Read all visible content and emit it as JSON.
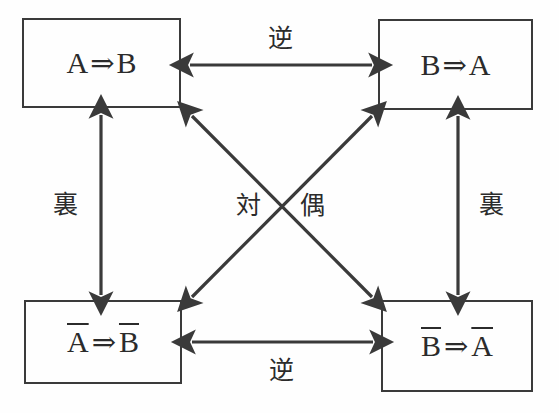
{
  "diagram": {
    "type": "logic-relation-diagram",
    "colors": {
      "line": "#3a3a3a",
      "text": "#2b2b2b",
      "background": "#fefefe"
    },
    "nodes": [
      {
        "id": "original",
        "role": "original-proposition",
        "position": "top-left",
        "antecedent": "A",
        "antecedent_negated": false,
        "consequent": "B",
        "consequent_negated": false,
        "implication": "⇒",
        "plain": "A ⇒ B",
        "box": {
          "x": 22,
          "y": 18,
          "w": 159,
          "h": 90
        }
      },
      {
        "id": "converse",
        "role": "converse-proposition",
        "position": "top-right",
        "antecedent": "B",
        "antecedent_negated": false,
        "consequent": "A",
        "consequent_negated": false,
        "implication": "⇒",
        "plain": "B ⇒ A",
        "box": {
          "x": 378,
          "y": 19,
          "w": 155,
          "h": 91
        }
      },
      {
        "id": "inverse",
        "role": "inverse-proposition",
        "position": "bottom-left",
        "antecedent": "A",
        "antecedent_negated": true,
        "consequent": "B",
        "consequent_negated": true,
        "implication": "⇒",
        "plain": "Ā ⇒ B̄",
        "box": {
          "x": 24,
          "y": 300,
          "w": 158,
          "h": 84
        }
      },
      {
        "id": "contrapositive",
        "role": "contrapositive-proposition",
        "position": "bottom-right",
        "antecedent": "B",
        "antecedent_negated": true,
        "consequent": "A",
        "consequent_negated": true,
        "implication": "⇒",
        "plain": "B̄ ⇒ Ā",
        "box": {
          "x": 381,
          "y": 300,
          "w": 152,
          "h": 92
        }
      }
    ],
    "edges": [
      {
        "id": "edge-top",
        "label": "逆",
        "meaning": "converse",
        "from": "original",
        "to": "converse",
        "orientation": "horizontal",
        "arrowheads": "both",
        "label_position": {
          "x": 280,
          "y": 40
        }
      },
      {
        "id": "edge-bottom",
        "label": "逆",
        "meaning": "converse",
        "from": "inverse",
        "to": "contrapositive",
        "orientation": "horizontal",
        "arrowheads": "both",
        "label_position": {
          "x": 281,
          "y": 372
        }
      },
      {
        "id": "edge-left",
        "label": "裏",
        "meaning": "inverse",
        "from": "original",
        "to": "inverse",
        "orientation": "vertical",
        "arrowheads": "both",
        "label_position": {
          "x": 65,
          "y": 206
        }
      },
      {
        "id": "edge-right",
        "label": "裏",
        "meaning": "inverse",
        "from": "converse",
        "to": "contrapositive",
        "orientation": "vertical",
        "arrowheads": "both",
        "label_position": {
          "x": 491,
          "y": 206
        }
      },
      {
        "id": "edge-diagonal-main",
        "label": "対",
        "meaning": "contrapositive-part-1",
        "from": "original",
        "to": "contrapositive",
        "orientation": "diagonal",
        "arrowheads": "both",
        "label_position": {
          "x": 248,
          "y": 207
        }
      },
      {
        "id": "edge-diagonal-anti",
        "label": "偶",
        "meaning": "contrapositive-part-2",
        "from": "inverse",
        "to": "converse",
        "orientation": "diagonal",
        "arrowheads": "both",
        "label_position": {
          "x": 312,
          "y": 207
        }
      }
    ]
  }
}
